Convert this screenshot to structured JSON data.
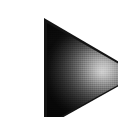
{
  "image": {
    "kind": "rendered-shape",
    "caption": "Shaded triangle",
    "width_px": 118,
    "height_px": 117,
    "background_color": "#ffffff"
  },
  "shape": {
    "name": "triangle",
    "orientation": "pointing-right",
    "vertices": [
      {
        "label": "top-left",
        "x": 4,
        "y": 2
      },
      {
        "label": "bottom-left",
        "x": 4,
        "y": 112
      },
      {
        "label": "apex-right",
        "x": 100,
        "y": 58
      }
    ],
    "edge_color": "#141414",
    "face_colors": {
      "highlight": "#e2e2e2",
      "midtone": "#737373",
      "shadow": "#151515"
    },
    "highlight": {
      "label": "specular-highlight",
      "center_x": 61,
      "center_y": 56,
      "color": "#e2e2e2"
    },
    "texture": "compression-noise"
  },
  "margins": {
    "left_px": 4,
    "top_px": 2,
    "right_px": 17,
    "bottom_px": 5
  }
}
